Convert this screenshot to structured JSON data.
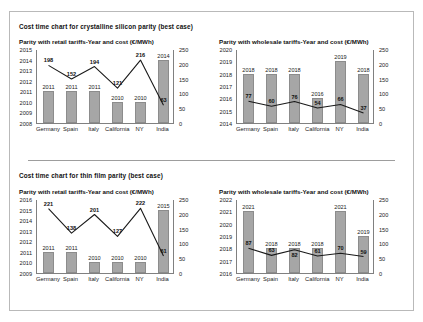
{
  "sections": [
    {
      "title": "Cost time chart for crystalline silicon parity (best case)",
      "charts": [
        {
          "subtitle": "Parity with retail tariffs-Year and cost (€/MWh)",
          "left_axis": [
            "2015",
            "2014",
            "2013",
            "2012",
            "2011",
            "2010",
            "2009",
            "2008"
          ],
          "right_axis": [
            "250",
            "200",
            "150",
            "100",
            "50",
            "0"
          ],
          "categories": [
            "Germany",
            "Spain",
            "Italy",
            "California",
            "NY",
            "India"
          ],
          "bar_values": [
            2011,
            2011,
            2011,
            2010,
            2010,
            2014
          ],
          "bar_labels": [
            "2011",
            "2011",
            "2011",
            "2010",
            "2010",
            "2014"
          ],
          "line_values": [
            198,
            152,
            194,
            121,
            216,
            63
          ],
          "line_labels": [
            "198",
            "152",
            "194",
            "121",
            "216",
            "63"
          ]
        },
        {
          "subtitle": "Parity with wholesale tariffs-Year and cost (€/MWh)",
          "left_axis": [
            "2020",
            "2019",
            "2018",
            "2017",
            "2016",
            "2015",
            "2014"
          ],
          "right_axis": [
            "250",
            "200",
            "150",
            "100",
            "50",
            "0"
          ],
          "categories": [
            "Germany",
            "Spain",
            "Italy",
            "California",
            "NY",
            "India"
          ],
          "bar_values": [
            2018,
            2018,
            2018,
            2016,
            2019,
            2018
          ],
          "bar_labels": [
            "2018",
            "2018",
            "2018",
            "2016",
            "2019",
            "2018"
          ],
          "line_values": [
            77,
            60,
            76,
            54,
            66,
            37
          ],
          "line_labels": [
            "77",
            "60",
            "76",
            "54",
            "66",
            "37"
          ]
        }
      ]
    },
    {
      "title": "Cost time chart for thin film parity (best case)",
      "charts": [
        {
          "subtitle": "Parity with retail tariffs-Year and cost (€/MWh)",
          "left_axis": [
            "2016",
            "2015",
            "2014",
            "2013",
            "2012",
            "2011",
            "2010",
            "2009"
          ],
          "right_axis": [
            "250",
            "200",
            "150",
            "100",
            "50",
            "0"
          ],
          "categories": [
            "Germany",
            "Spain",
            "Italy",
            "California",
            "NY",
            "India"
          ],
          "bar_values": [
            2011,
            2011,
            2010,
            2010,
            2010,
            2015
          ],
          "bar_labels": [
            "2011",
            "2011",
            "2010",
            "2010",
            "2010",
            "2015"
          ],
          "line_values": [
            221,
            138,
            201,
            127,
            222,
            61
          ],
          "line_labels": [
            "221",
            "138",
            "201",
            "127",
            "222",
            "61"
          ]
        },
        {
          "subtitle": "Parity with wholesale tariffs-Year and cost (€/MWh)",
          "left_axis": [
            "2022",
            "2021",
            "2020",
            "2019",
            "2018",
            "2017",
            "2016"
          ],
          "right_axis": [
            "250",
            "200",
            "150",
            "100",
            "50",
            "0"
          ],
          "categories": [
            "Germany",
            "Spain",
            "Italy",
            "California",
            "NY",
            "India"
          ],
          "bar_values": [
            2021,
            2018,
            2018,
            2018,
            2021,
            2019
          ],
          "bar_labels": [
            "2021",
            "2018",
            "2018",
            "2018",
            "2021",
            "2019"
          ],
          "line_values": [
            87,
            63,
            82,
            61,
            70,
            59
          ],
          "line_labels": [
            "87",
            "63",
            "82",
            "61",
            "70",
            "59"
          ]
        }
      ]
    }
  ],
  "chart_data": [
    {
      "type": "bar",
      "title": "Cost time chart for crystalline silicon parity (best case) — Parity with retail tariffs-Year and cost (€/MWh)",
      "categories": [
        "Germany",
        "Spain",
        "Italy",
        "California",
        "NY",
        "India"
      ],
      "series": [
        {
          "name": "Year of parity (bars)",
          "values": [
            2011,
            2011,
            2011,
            2010,
            2010,
            2014
          ],
          "axis": "left"
        },
        {
          "name": "Cost (€/MWh) (line)",
          "values": [
            198,
            152,
            194,
            121,
            216,
            63
          ],
          "axis": "right"
        }
      ],
      "ylim_left": [
        2008,
        2015
      ],
      "ylim_right": [
        0,
        250
      ],
      "xlabel": "",
      "ylabel": "Year",
      "ylabel_right": "€/MWh",
      "grid": false,
      "legend": "none"
    },
    {
      "type": "bar",
      "title": "Cost time chart for crystalline silicon parity (best case) — Parity with wholesale tariffs-Year and cost (€/MWh)",
      "categories": [
        "Germany",
        "Spain",
        "Italy",
        "California",
        "NY",
        "India"
      ],
      "series": [
        {
          "name": "Year of parity (bars)",
          "values": [
            2018,
            2018,
            2018,
            2016,
            2019,
            2018
          ],
          "axis": "left"
        },
        {
          "name": "Cost (€/MWh) (line)",
          "values": [
            77,
            60,
            76,
            54,
            66,
            37
          ],
          "axis": "right"
        }
      ],
      "ylim_left": [
        2014,
        2020
      ],
      "ylim_right": [
        0,
        250
      ],
      "xlabel": "",
      "ylabel": "Year",
      "ylabel_right": "€/MWh",
      "grid": false,
      "legend": "none"
    },
    {
      "type": "bar",
      "title": "Cost time chart for thin film parity (best case) — Parity with retail tariffs-Year and cost (€/MWh)",
      "categories": [
        "Germany",
        "Spain",
        "Italy",
        "California",
        "NY",
        "India"
      ],
      "series": [
        {
          "name": "Year of parity (bars)",
          "values": [
            2011,
            2011,
            2010,
            2010,
            2010,
            2015
          ],
          "axis": "left"
        },
        {
          "name": "Cost (€/MWh) (line)",
          "values": [
            221,
            138,
            201,
            127,
            222,
            61
          ],
          "axis": "right"
        }
      ],
      "ylim_left": [
        2009,
        2016
      ],
      "ylim_right": [
        0,
        250
      ],
      "xlabel": "",
      "ylabel": "Year",
      "ylabel_right": "€/MWh",
      "grid": false,
      "legend": "none"
    },
    {
      "type": "bar",
      "title": "Cost time chart for thin film parity (best case) — Parity with wholesale tariffs-Year and cost (€/MWh)",
      "categories": [
        "Germany",
        "Spain",
        "Italy",
        "California",
        "NY",
        "India"
      ],
      "series": [
        {
          "name": "Year of parity (bars)",
          "values": [
            2021,
            2018,
            2018,
            2018,
            2021,
            2019
          ],
          "axis": "left"
        },
        {
          "name": "Cost (€/MWh) (line)",
          "values": [
            87,
            63,
            82,
            61,
            70,
            59
          ],
          "axis": "right"
        }
      ],
      "ylim_left": [
        2016,
        2022
      ],
      "ylim_right": [
        0,
        250
      ],
      "xlabel": "",
      "ylabel": "Year",
      "ylabel_right": "€/MWh",
      "grid": false,
      "legend": "none"
    }
  ]
}
